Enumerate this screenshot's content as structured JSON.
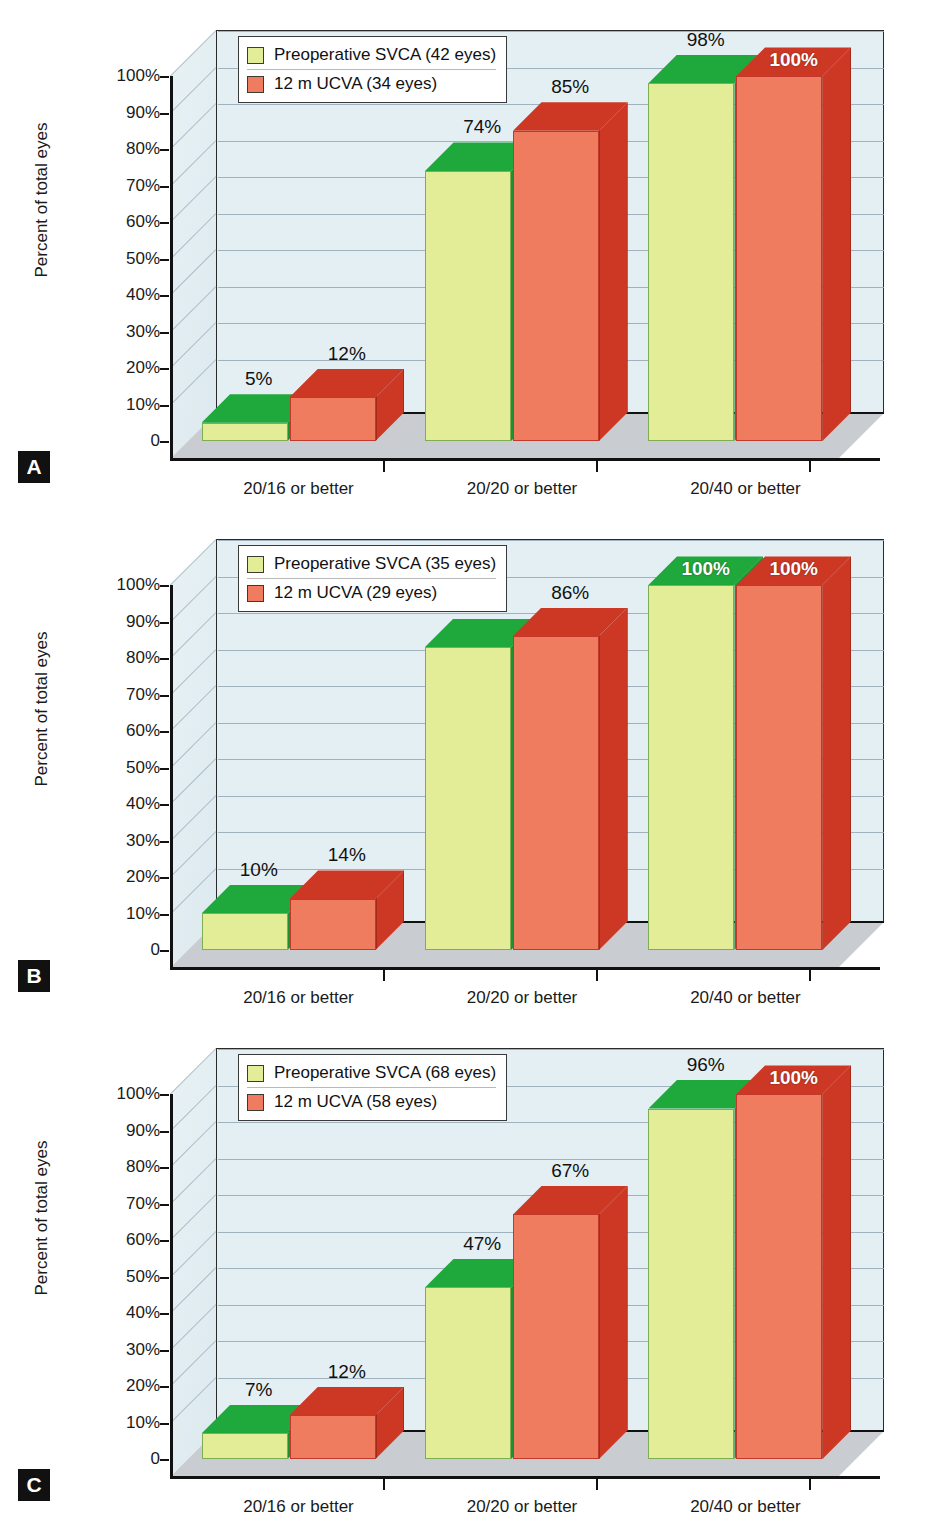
{
  "figure": {
    "axis": {
      "ylabel": "Percent of total eyes",
      "yticks": [
        "100%",
        "90%",
        "80%",
        "70%",
        "60%",
        "50%",
        "40%",
        "30%",
        "20%",
        "10%",
        "0"
      ],
      "categories": [
        "20/16 or better",
        "20/20 or better",
        "20/40 or better"
      ]
    },
    "colors": {
      "series_green_front": "#e3ec97",
      "series_green_top": "#1fa83b",
      "series_red_front": "#ef7c5e",
      "series_red_top": "#cd3825",
      "plot_background": "#e4eff3",
      "floor": "#c9cdd1",
      "gridline": "#94a7b4"
    },
    "panels": [
      {
        "letter": "A",
        "legend": [
          "Preoperative SVCA (42 eyes)",
          "12 m UCVA (34 eyes)"
        ],
        "labels": {
          "green": [
            "5%",
            "74%",
            "98%"
          ],
          "red": [
            "12%",
            "85%",
            "100%"
          ]
        }
      },
      {
        "letter": "B",
        "legend": [
          "Preoperative SVCA (35 eyes)",
          "12 m UCVA (29 eyes)"
        ],
        "labels": {
          "green": [
            "10%",
            "83%",
            "100%"
          ],
          "red": [
            "14%",
            "86%",
            "100%"
          ]
        }
      },
      {
        "letter": "C",
        "legend": [
          "Preoperative SVCA (68 eyes)",
          "12 m UCVA (58 eyes)"
        ],
        "labels": {
          "green": [
            "7%",
            "47%",
            "96%"
          ],
          "red": [
            "12%",
            "67%",
            "100%"
          ]
        }
      }
    ]
  },
  "chart_data": [
    {
      "type": "bar",
      "panel": "A",
      "title": "",
      "xlabel": "",
      "ylabel": "Percent of total eyes",
      "ylim": [
        0,
        100
      ],
      "grid": true,
      "legend_position": "top-left",
      "categories": [
        "20/16 or better",
        "20/20 or better",
        "20/40 or better"
      ],
      "series": [
        {
          "name": "Preoperative SVCA (42 eyes)",
          "values": [
            5,
            74,
            98
          ],
          "color": "#e3ec97"
        },
        {
          "name": "12 m UCVA (34 eyes)",
          "values": [
            12,
            85,
            100
          ],
          "color": "#ef7c5e"
        }
      ]
    },
    {
      "type": "bar",
      "panel": "B",
      "title": "",
      "xlabel": "",
      "ylabel": "Percent of total eyes",
      "ylim": [
        0,
        100
      ],
      "grid": true,
      "legend_position": "top-left",
      "categories": [
        "20/16 or better",
        "20/20 or better",
        "20/40 or better"
      ],
      "series": [
        {
          "name": "Preoperative SVCA (35 eyes)",
          "values": [
            10,
            83,
            100
          ],
          "color": "#e3ec97"
        },
        {
          "name": "12 m UCVA (29 eyes)",
          "values": [
            14,
            86,
            100
          ],
          "color": "#ef7c5e"
        }
      ]
    },
    {
      "type": "bar",
      "panel": "C",
      "title": "",
      "xlabel": "",
      "ylabel": "Percent of total eyes",
      "ylim": [
        0,
        100
      ],
      "grid": true,
      "legend_position": "top-left",
      "categories": [
        "20/16 or better",
        "20/20 or better",
        "20/40 or better"
      ],
      "series": [
        {
          "name": "Preoperative SVCA (68 eyes)",
          "values": [
            7,
            47,
            96
          ],
          "color": "#e3ec97"
        },
        {
          "name": "12 m UCVA (58 eyes)",
          "values": [
            12,
            67,
            100
          ],
          "color": "#ef7c5e"
        }
      ]
    }
  ]
}
